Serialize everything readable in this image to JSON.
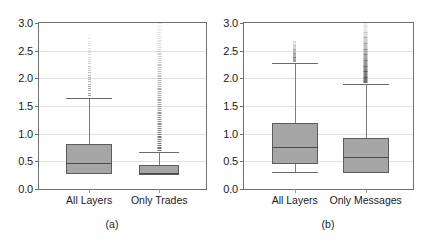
{
  "chart_data": [
    {
      "type": "box",
      "panel": "(a)",
      "title": "",
      "xlabel": "",
      "ylabel": "",
      "ylim": [
        0.0,
        3.0
      ],
      "yticks": [
        "0.0",
        "0.5",
        "1.0",
        "1.5",
        "2.0",
        "2.5",
        "3.0"
      ],
      "ytick_values": [
        0.0,
        0.5,
        1.0,
        1.5,
        2.0,
        2.5,
        3.0
      ],
      "grid": true,
      "categories": [
        "All Layers",
        "Only Trades"
      ],
      "boxes": [
        {
          "label": "All Layers",
          "whisker_low": 0.28,
          "q1": 0.28,
          "median": 0.47,
          "q3": 0.82,
          "whisker_high": 1.65,
          "outliers_from": 1.7,
          "outliers_to": 2.72,
          "outlier_density": "sparse"
        },
        {
          "label": "Only Trades",
          "whisker_low": 0.26,
          "q1": 0.26,
          "median": 0.29,
          "q3": 0.44,
          "whisker_high": 0.66,
          "outliers_from": 0.7,
          "outliers_to": 3.0,
          "outlier_density": "dense"
        }
      ]
    },
    {
      "type": "box",
      "panel": "(b)",
      "title": "",
      "xlabel": "",
      "ylabel": "",
      "ylim": [
        0.0,
        3.0
      ],
      "yticks": [
        "0.0",
        "0.5",
        "1.0",
        "1.5",
        "2.0",
        "2.5",
        "3.0"
      ],
      "ytick_values": [
        0.0,
        0.5,
        1.0,
        1.5,
        2.0,
        2.5,
        3.0
      ],
      "grid": true,
      "categories": [
        "All Layers",
        "Only Messages"
      ],
      "boxes": [
        {
          "label": "All Layers",
          "whisker_low": 0.3,
          "q1": 0.45,
          "median": 0.76,
          "q3": 1.2,
          "whisker_high": 2.28,
          "outliers_from": 2.32,
          "outliers_to": 2.68,
          "outlier_density": "sparse"
        },
        {
          "label": "Only Messages",
          "whisker_low": 0.28,
          "q1": 0.28,
          "median": 0.58,
          "q3": 0.93,
          "whisker_high": 1.9,
          "outliers_from": 1.94,
          "outliers_to": 3.0,
          "outlier_density": "dense"
        }
      ]
    }
  ],
  "panel_a": {
    "caption": "(a)",
    "yticks": [
      "3.0",
      "2.5",
      "2.0",
      "1.5",
      "1.0",
      "0.5",
      "0.0"
    ],
    "xticks": [
      "All Layers",
      "Only Trades"
    ]
  },
  "panel_b": {
    "caption": "(b)",
    "yticks": [
      "3.0",
      "2.5",
      "2.0",
      "1.5",
      "1.0",
      "0.5",
      "0.0"
    ],
    "xticks": [
      "All Layers",
      "Only Messages"
    ]
  }
}
